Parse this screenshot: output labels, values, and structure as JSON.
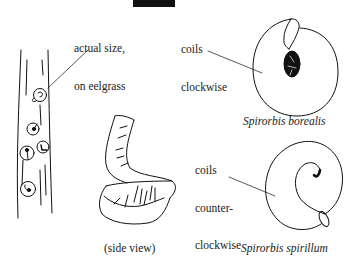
{
  "figure": {
    "labels": {
      "actual_size": [
        "actual size,",
        "on eelgrass"
      ],
      "clockwise": [
        "coils",
        "clockwise"
      ],
      "counter_clockwise": [
        "coils",
        "counter-",
        "clockwise"
      ],
      "side_view": "(side view)",
      "species_borealis": "Spirorbis borealis",
      "species_spirillum": "Spirorbis spirillum"
    },
    "colors": {
      "ink": "#111111",
      "background": "#ffffff",
      "text": "#222222"
    }
  }
}
